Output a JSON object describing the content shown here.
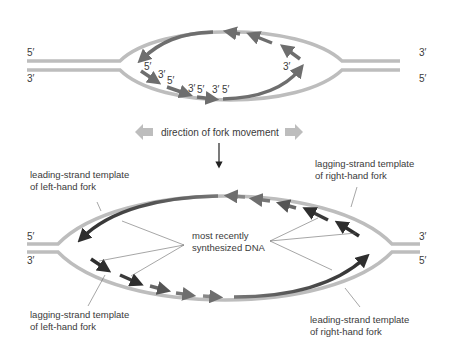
{
  "colors": {
    "template_strand": "#bdbdbd",
    "new_strand_old": "#6e6e6e",
    "new_strand_recent": "#2e2e2e",
    "direction_arrow": "#bdbdbd",
    "text": "#3a3a3a",
    "leader_line": "#6a6a6a"
  },
  "top_panel": {
    "left_end_top": "5′",
    "left_end_bottom": "3′",
    "right_end_top": "3′",
    "right_end_bottom": "5′",
    "okazaki_labels": [
      "5′",
      "3′",
      "5′",
      "3′",
      "5′",
      "3′",
      "5′"
    ],
    "leading_end_label": "3′"
  },
  "direction": {
    "label": "direction of fork movement",
    "left_arrow_icon": "left-arrow",
    "right_arrow_icon": "right-arrow",
    "down_arrow_icon": "down-arrow"
  },
  "bottom_panel": {
    "left_end_top": "5′",
    "left_end_bottom": "3′",
    "right_end_top": "3′",
    "right_end_bottom": "5′",
    "center_label_line1": "most recently",
    "center_label_line2": "synthesized DNA",
    "callouts": {
      "leading_left_line1": "leading-strand template",
      "leading_left_line2": "of left-hand fork",
      "lagging_right_line1": "lagging-strand template",
      "lagging_right_line2": "of right-hand fork",
      "lagging_left_line1": "lagging-strand template",
      "lagging_left_line2": "of left-hand fork",
      "leading_right_line1": "leading-strand template",
      "leading_right_line2": "of right-hand fork"
    }
  }
}
